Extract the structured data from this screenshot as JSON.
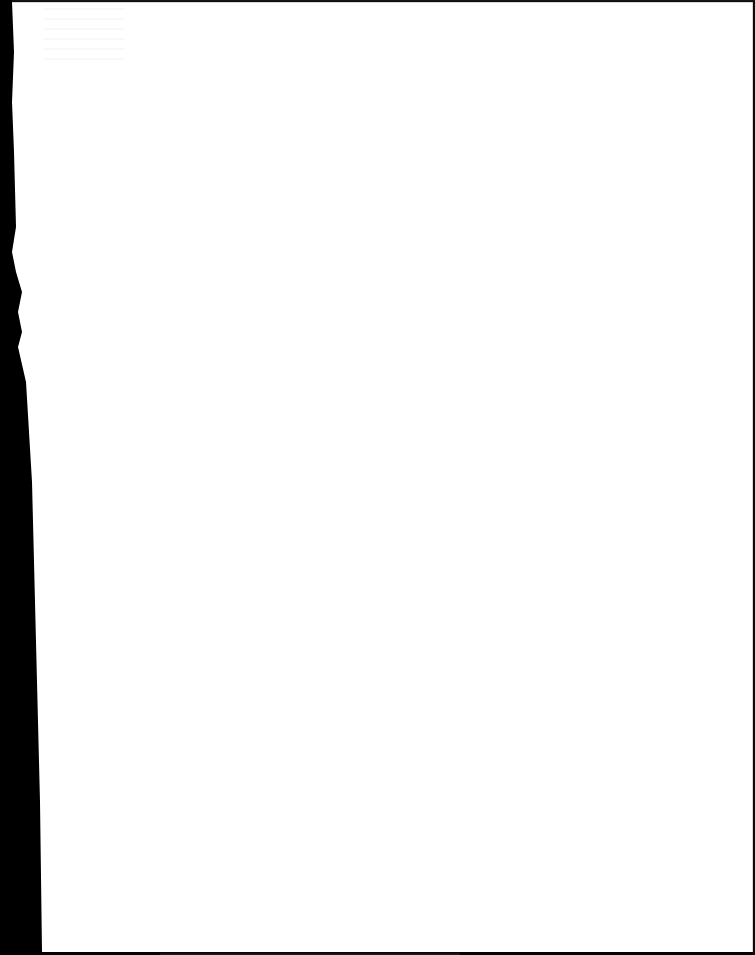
{
  "document": {
    "type": "scanned-page",
    "content_visible": false,
    "text": ""
  },
  "colors": {
    "paper": "#ffffff",
    "scanner_background": "#000000"
  }
}
